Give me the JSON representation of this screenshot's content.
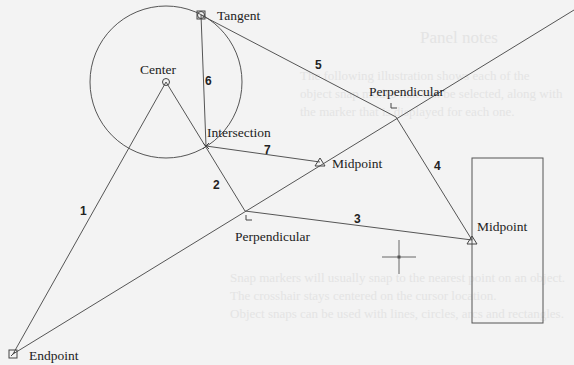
{
  "title": "Object snap modes",
  "background_text": [
    "Panel notes",
    "The following illustration shows each of the",
    "object snap modes that can be selected, along with",
    "the marker that is displayed for each one.",
    "Snap markers will usually snap to the nearest point on an object.",
    "The crosshair stays centered on the cursor location.",
    "Object snaps can be used with lines, circles, arcs and rectangles."
  ],
  "colors": {
    "background": "#f3f3f3",
    "line": "#555555",
    "text": "#222222"
  },
  "snap_points": [
    {
      "id": "tangent",
      "label": "Tangent",
      "marker": "circle-in-square",
      "x": 201,
      "y": 15
    },
    {
      "id": "center",
      "label": "Center",
      "marker": "circle",
      "x": 166,
      "y": 82
    },
    {
      "id": "intersection",
      "label": "Intersection",
      "marker": "x",
      "x": 206,
      "y": 146
    },
    {
      "id": "perpendicular-upper",
      "label": "Perpendicular",
      "marker": "right-angle",
      "x": 396,
      "y": 117
    },
    {
      "id": "midpoint-inner",
      "label": "Midpoint",
      "marker": "triangle",
      "x": 320,
      "y": 162
    },
    {
      "id": "perpendicular-lower",
      "label": "Perpendicular",
      "marker": "right-angle",
      "x": 245,
      "y": 211
    },
    {
      "id": "midpoint-rect",
      "label": "Midpoint",
      "marker": "triangle",
      "x": 472,
      "y": 240
    },
    {
      "id": "endpoint",
      "label": "Endpoint",
      "marker": "square",
      "x": 13,
      "y": 354
    }
  ],
  "segments": [
    {
      "number": "1",
      "from": "endpoint",
      "to": "center"
    },
    {
      "number": "2",
      "from": "center",
      "to": "perpendicular-lower"
    },
    {
      "number": "3",
      "from": "perpendicular-lower",
      "to": "midpoint-rect"
    },
    {
      "number": "4",
      "from": "perpendicular-upper",
      "to": "midpoint-rect"
    },
    {
      "number": "5",
      "from": "tangent",
      "to": "perpendicular-upper"
    },
    {
      "number": "6",
      "from": "tangent",
      "to": "intersection"
    },
    {
      "number": "7",
      "from": "intersection",
      "to": "midpoint-inner"
    }
  ],
  "shapes": {
    "circle": {
      "cx": 166,
      "cy": 82,
      "r": 76
    },
    "rectangle": {
      "x": 472,
      "y": 158,
      "width": 71,
      "height": 165
    },
    "long_line": {
      "x1": 13,
      "y1": 354,
      "x2": 574,
      "y2": 10
    }
  },
  "cursor": {
    "type": "crosshair",
    "x": 399,
    "y": 257
  }
}
